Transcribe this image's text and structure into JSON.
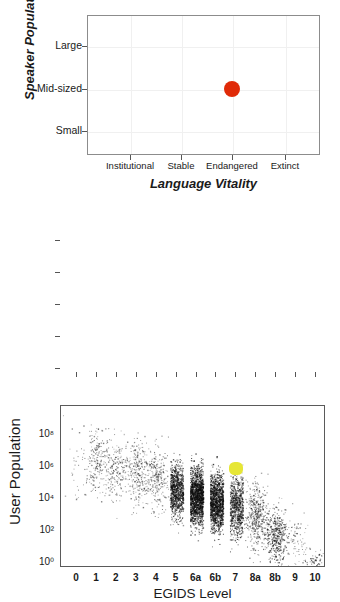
{
  "chart_data": [
    {
      "type": "scatter",
      "id": "speaker-population-vs-language-vitality",
      "title": "",
      "xlabel": "Language Vitality",
      "ylabel": "Speaker Population",
      "x_ticklabels": [
        "Institutional",
        "Stable",
        "Endangered",
        "Extinct"
      ],
      "y_ticklabels": [
        "Large",
        "Mid-sized",
        "Small"
      ],
      "grid": true,
      "legend": "none",
      "point_color": "#e02a08",
      "points": [
        {
          "x": "Endangered",
          "y": "Mid-sized",
          "color": "#e02a08",
          "size": 16
        }
      ]
    },
    {
      "type": "scatter",
      "id": "user-population-vs-egids-level",
      "title": "",
      "xlabel": "EGIDS Level",
      "ylabel": "User Population",
      "x_ticklabels": [
        "0",
        "1",
        "2",
        "3",
        "4",
        "5",
        "6a",
        "6b",
        "7",
        "8a",
        "8b",
        "9",
        "10"
      ],
      "y_ticklabels": [
        "10⁰",
        "10²",
        "10⁴",
        "10⁶",
        "10⁸"
      ],
      "y_tick_values": [
        1,
        100,
        10000,
        1000000,
        100000000
      ],
      "ylim": [
        1,
        1000000000
      ],
      "yscale": "log",
      "grid": false,
      "legend": "none",
      "cloud_color": "#111111",
      "highlight_color": "#e6e636",
      "highlight_point": {
        "x": "7",
        "y": 1000000,
        "color": "#e6e636"
      },
      "density_by_level": [
        {
          "level": "0",
          "count": 30,
          "y_center": 3000000,
          "y_spread": 2.0,
          "opacity": 0.55
        },
        {
          "level": "1",
          "count": 220,
          "y_center": 3000000,
          "y_spread": 1.7,
          "opacity": 0.55
        },
        {
          "level": "2",
          "count": 200,
          "y_center": 1200000,
          "y_spread": 1.7,
          "opacity": 0.55
        },
        {
          "level": "3",
          "count": 260,
          "y_center": 700000,
          "y_spread": 1.7,
          "opacity": 0.55
        },
        {
          "level": "4",
          "count": 260,
          "y_center": 250000,
          "y_spread": 1.7,
          "opacity": 0.55
        },
        {
          "level": "5",
          "count": 900,
          "y_center": 40000,
          "y_spread": 1.4,
          "opacity": 0.75
        },
        {
          "level": "6a",
          "count": 1400,
          "y_center": 18000,
          "y_spread": 1.5,
          "opacity": 0.85
        },
        {
          "level": "6b",
          "count": 1200,
          "y_center": 8000,
          "y_spread": 1.5,
          "opacity": 0.85
        },
        {
          "level": "7",
          "count": 800,
          "y_center": 5000,
          "y_spread": 1.7,
          "opacity": 0.7
        },
        {
          "level": "8a",
          "count": 420,
          "y_center": 1200,
          "y_spread": 1.7,
          "opacity": 0.6
        },
        {
          "level": "8b",
          "count": 420,
          "y_center": 60,
          "y_spread": 1.4,
          "opacity": 0.7
        },
        {
          "level": "9",
          "count": 90,
          "y_center": 30,
          "y_spread": 1.6,
          "opacity": 0.5
        },
        {
          "level": "10",
          "count": 60,
          "y_center": 1.5,
          "y_spread": 0.5,
          "opacity": 0.7
        }
      ]
    }
  ],
  "top_chart": {
    "ylabel": "Speaker Population",
    "xlabel": "Language Vitality",
    "yticks": [
      "Large",
      "Mid-sized",
      "Small"
    ],
    "xticks": [
      "Institutional",
      "Stable",
      "Endangered",
      "Extinct"
    ]
  },
  "bottom_chart": {
    "ylabel": "User Population",
    "xlabel": "EGIDS Level",
    "yticks": [
      "10⁸",
      "10⁶",
      "10⁴",
      "10²",
      "10⁰"
    ],
    "xticks": [
      "0",
      "1",
      "2",
      "3",
      "4",
      "5",
      "6a",
      "6b",
      "7",
      "8a",
      "8b",
      "9",
      "10"
    ]
  }
}
